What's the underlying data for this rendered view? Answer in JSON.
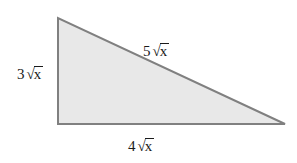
{
  "figure": {
    "kind": "right-triangle-diagram",
    "background_color": "#ffffff",
    "shape": {
      "fill_color": "#e8e8e8",
      "stroke_color": "#808080",
      "stroke_width": 2,
      "vertices": {
        "top_left": [
          58,
          18
        ],
        "bottom_left": [
          58,
          124
        ],
        "bottom_right": [
          285,
          124
        ]
      }
    },
    "labels": {
      "left_leg": {
        "coefficient": "3",
        "radical_sign": "√",
        "radicand": "x",
        "full_text": "3√x"
      },
      "hypotenuse": {
        "coefficient": "5",
        "radical_sign": "√",
        "radicand": "x",
        "full_text": "5√x"
      },
      "bottom_leg": {
        "coefficient": "4",
        "radical_sign": "√",
        "radicand": "x",
        "full_text": "4√x"
      }
    }
  }
}
